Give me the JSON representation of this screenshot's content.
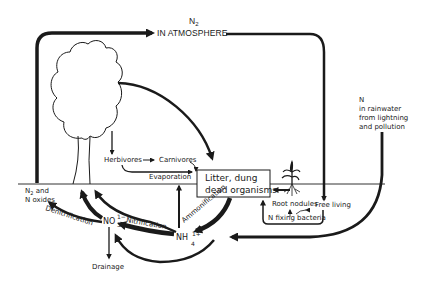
{
  "diagram": {
    "colors": {
      "ink": "#1a1a1a",
      "background": "#ffffff"
    },
    "nodes": {
      "atmosphere": {
        "line1": "N",
        "sub": "2",
        "line2": "IN ATMOSPHERE"
      },
      "rainwater": {
        "line1": "N",
        "line2": "in rainwater",
        "line3": "from lightning",
        "line4": "and pollution"
      },
      "herbivores": "Herbivores",
      "carnivores": "Carnivores",
      "evaporation": "Evaporation",
      "litter": {
        "line1": "Litter, dung",
        "line2": "dead organisms"
      },
      "root_nodules": "Root nodules",
      "free_living": "Free living",
      "n_fixing": "N fixing bacteria",
      "n2_oxides": {
        "line1a": "N",
        "line1sub": "2",
        "line1b": " and",
        "line2": "N oxides"
      },
      "nitrate": {
        "base": "NO",
        "sub": "3",
        "sup": "1−"
      },
      "ammonium": {
        "base": "NH",
        "sub": "4",
        "sup": "1+"
      },
      "drainage": "Drainage"
    },
    "processes": {
      "denitrification": "Denitrification",
      "nitrification": "Nitrification",
      "ammonification": "Ammonification"
    },
    "icons": {
      "tree": "tree-icon",
      "plant": "legume-plant-icon"
    }
  }
}
